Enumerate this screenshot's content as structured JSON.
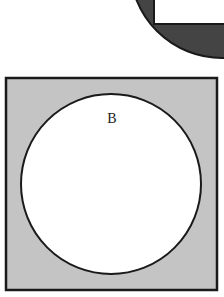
{
  "figures": {
    "top": {
      "description": "complement of circle within square (partial, cropped)",
      "outer_fill": "#444444",
      "inner_fill": "#ffffff"
    },
    "bottom": {
      "label": "B",
      "square_fill": "#c4c4c4",
      "circle_fill": "#ffffff",
      "stroke": "#1a1a1a"
    }
  }
}
